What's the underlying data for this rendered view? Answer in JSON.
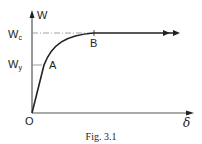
{
  "figure": {
    "caption": "Fig. 3.1",
    "y_axis_label": "W",
    "x_axis_label": "δ",
    "origin_label": "O",
    "levels": {
      "wc_main": "W",
      "wc_sub": "c",
      "wy_main": "W",
      "wy_sub": "y"
    },
    "points": {
      "a": "A",
      "b": "B"
    },
    "colors": {
      "ink": "#222222",
      "guide": "#888888"
    }
  }
}
